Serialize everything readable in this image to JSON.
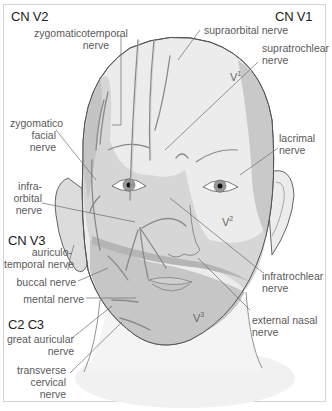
{
  "diagram": {
    "type": "anatomical",
    "groups": [
      {
        "id": "cn_v2",
        "label": "CN V2"
      },
      {
        "id": "cn_v1",
        "label": "CN V1"
      },
      {
        "id": "cn_v3",
        "label": "CN V3"
      },
      {
        "id": "c2_c3",
        "label": "C2 C3"
      }
    ],
    "zones": [
      {
        "base": "V",
        "sup": "1"
      },
      {
        "base": "V",
        "sup": "2"
      },
      {
        "base": "V",
        "sup": "3"
      }
    ],
    "labels": {
      "zygomaticotemporal": [
        "zygomaticotemporal",
        "nerve"
      ],
      "zygomaticofacial": [
        "zygomatico",
        "facial",
        "nerve"
      ],
      "infraorbital": [
        "infra-",
        "orbital",
        "nerve"
      ],
      "auriculotemporal": [
        "auriculo-",
        "temporal nerve"
      ],
      "buccal": [
        "buccal nerve"
      ],
      "mental": [
        "mental nerve"
      ],
      "great_auricular": [
        "great auricular",
        "nerve"
      ],
      "transverse_cervical": [
        "transverse",
        "cervical",
        "nerve"
      ],
      "supraorbital": [
        "supraorbital nerve"
      ],
      "supratrochlear": [
        "supratrochlear",
        "nerve"
      ],
      "lacrimal": [
        "lacrimal",
        "nerve"
      ],
      "infratrochlear": [
        "infratrochlear",
        "nerve"
      ],
      "external_nasal": [
        "external nasal",
        "nerve"
      ]
    },
    "colors": {
      "v1": "#ececec",
      "v2": "#d6d6d6",
      "v3": "#c4c4c4",
      "band": "#b8b8b8",
      "outline": "#555555",
      "nerve": "#8a8a8a",
      "leader": "#6a6a6a"
    }
  }
}
